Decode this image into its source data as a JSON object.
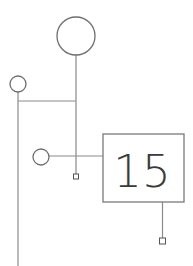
{
  "diagram": {
    "colors": {
      "line": "#8a8a8a",
      "node_stroke": "#6e6e6e",
      "text": "#3a3a3a",
      "background": "#ffffff"
    },
    "box": {
      "label": "15",
      "x": 103,
      "y": 134,
      "width": 81,
      "height": 68
    },
    "nodes": [
      {
        "id": "large-circle",
        "cx": 76,
        "cy": 36,
        "r": 19
      },
      {
        "id": "small-circle-left",
        "cx": 18,
        "cy": 84,
        "r": 8
      },
      {
        "id": "small-circle-middle",
        "cx": 41,
        "cy": 157,
        "r": 8
      }
    ],
    "terminals": [
      {
        "id": "terminal-middle",
        "x": 73,
        "y": 174,
        "size": 5
      },
      {
        "id": "terminal-box",
        "x": 159.5,
        "y": 238,
        "size": 6
      }
    ]
  }
}
